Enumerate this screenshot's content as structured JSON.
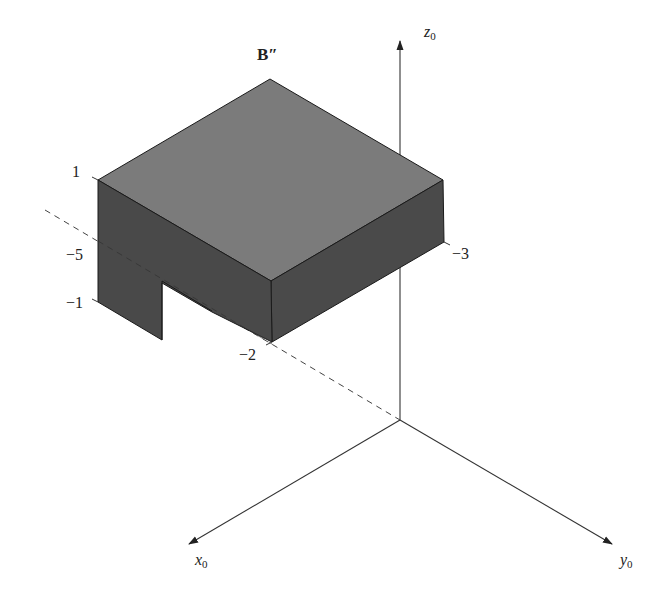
{
  "figure": {
    "title_label": "B″",
    "colors": {
      "top_face": "#7b7b7b",
      "side_face": "#4a4a4a",
      "edge": "#1a1a1a",
      "axis": "#333333",
      "dashed": "#444444",
      "background": "#ffffff"
    },
    "axes": {
      "z": {
        "name": "z",
        "subscript": "0"
      },
      "x": {
        "name": "x",
        "subscript": "0"
      },
      "y": {
        "name": "y",
        "subscript": "0"
      }
    },
    "tick_labels": {
      "left_top": "1",
      "left_mid": "−5",
      "left_bottom": "−1",
      "right": "−3",
      "front_bottom": "−2"
    }
  }
}
